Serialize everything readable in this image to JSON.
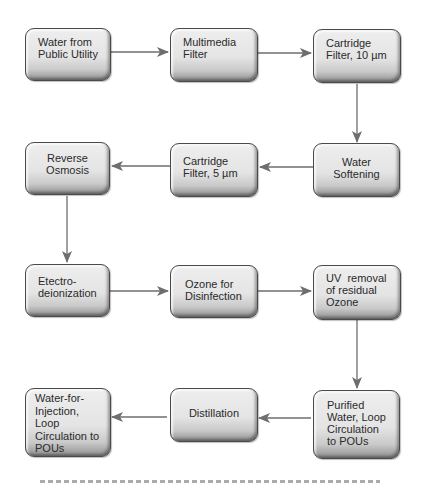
{
  "diagram": {
    "type": "process-flowchart",
    "nodes": [
      {
        "id": "n1",
        "lines": [
          "Water from",
          "Public Utility"
        ]
      },
      {
        "id": "n2",
        "lines": [
          "Multimedia",
          "Filter"
        ]
      },
      {
        "id": "n3",
        "lines": [
          "Cartridge",
          "Filter, 10 µm"
        ]
      },
      {
        "id": "n4",
        "lines": [
          "Water",
          "Softening"
        ]
      },
      {
        "id": "n5",
        "lines": [
          "Cartridge",
          "Filter, 5 µm"
        ]
      },
      {
        "id": "n6",
        "lines": [
          "Reverse",
          "Osmosis"
        ]
      },
      {
        "id": "n7",
        "lines": [
          "Etectro-",
          "deionization"
        ]
      },
      {
        "id": "n8",
        "lines": [
          "Ozone for",
          "Disinfection"
        ]
      },
      {
        "id": "n9",
        "lines": [
          "UV  removal",
          "of residual",
          "Ozone"
        ]
      },
      {
        "id": "n10",
        "lines": [
          "Purified",
          "Water, Loop",
          "Circulation",
          "to POUs"
        ]
      },
      {
        "id": "n11",
        "lines": [
          "Distillation"
        ]
      },
      {
        "id": "n12",
        "lines": [
          "Water-for-",
          "Injection,",
          "Loop",
          "Circulation to",
          "POUs"
        ]
      }
    ],
    "edges": [
      {
        "from": "n1",
        "to": "n2"
      },
      {
        "from": "n2",
        "to": "n3"
      },
      {
        "from": "n3",
        "to": "n4"
      },
      {
        "from": "n4",
        "to": "n5"
      },
      {
        "from": "n5",
        "to": "n6"
      },
      {
        "from": "n6",
        "to": "n7"
      },
      {
        "from": "n7",
        "to": "n8"
      },
      {
        "from": "n8",
        "to": "n9"
      },
      {
        "from": "n9",
        "to": "n10"
      },
      {
        "from": "n10",
        "to": "n11"
      },
      {
        "from": "n11",
        "to": "n12"
      }
    ],
    "colors": {
      "box_fill": "#e6e6e6",
      "box_border": "#4a4a4a",
      "arrow": "#6e6e6e",
      "text": "#2a2a2a"
    }
  }
}
